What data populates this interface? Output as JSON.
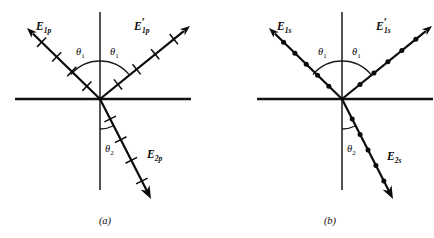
{
  "figure": {
    "type": "optics-ray-diagram",
    "background_color": "#ffffff",
    "ink_color": "#0b0b0b"
  },
  "panels": [
    {
      "id": "a",
      "caption": "(a)",
      "polarization": "p",
      "marker_style": "tick",
      "origin": {
        "x": 100,
        "y": 99
      },
      "interface": {
        "x1": 15,
        "y1": 99,
        "x2": 191,
        "y2": 99
      },
      "normal": {
        "x1": 100,
        "y1": 12,
        "x2": 100,
        "y2": 190
      },
      "rays": [
        {
          "name": "incident",
          "label": "E",
          "label_sub": "1p",
          "label_prime": false,
          "label_x": 36,
          "label_y": 30,
          "angle_deg": 40,
          "tail": {
            "x": 27,
            "y": 28
          },
          "head": {
            "x": 100,
            "y": 99
          },
          "marker_count": 4
        },
        {
          "name": "reflected",
          "label": "E",
          "label_sub": "1p",
          "label_prime": true,
          "label_x": 134,
          "label_y": 30,
          "angle_deg": 40,
          "tail": {
            "x": 100,
            "y": 99
          },
          "head": {
            "x": 190,
            "y": 26
          },
          "marker_count": 4
        },
        {
          "name": "transmitted",
          "label": "E",
          "label_sub": "2p",
          "label_prime": false,
          "label_x": 147,
          "label_y": 158,
          "angle_deg": 20,
          "tail": {
            "x": 100,
            "y": 99
          },
          "head": {
            "x": 151,
            "y": 199
          },
          "marker_count": 4
        }
      ],
      "angles": [
        {
          "name": "theta-1-incident",
          "symbol": "θ",
          "sub": "1",
          "x": 76,
          "y": 55
        },
        {
          "name": "theta-1-reflected",
          "symbol": "θ",
          "sub": "1",
          "x": 110,
          "y": 55
        },
        {
          "name": "theta-2-transmitted",
          "symbol": "θ",
          "sub": "2",
          "x": 105,
          "y": 152
        }
      ],
      "caption_x": 105,
      "caption_y": 224
    },
    {
      "id": "b",
      "caption": "(b)",
      "polarization": "s",
      "marker_style": "dot",
      "origin": {
        "x": 125,
        "y": 99
      },
      "interface": {
        "x1": 40,
        "y1": 99,
        "x2": 216,
        "y2": 99
      },
      "normal": {
        "x1": 125,
        "y1": 12,
        "x2": 125,
        "y2": 190
      },
      "rays": [
        {
          "name": "incident",
          "label": "E",
          "label_sub": "1s",
          "label_prime": false,
          "label_x": 60,
          "label_y": 30,
          "angle_deg": 40,
          "tail": {
            "x": 52,
            "y": 28
          },
          "head": {
            "x": 125,
            "y": 99
          },
          "marker_count": 5
        },
        {
          "name": "reflected",
          "label": "E",
          "label_sub": "1s",
          "label_prime": true,
          "label_x": 159,
          "label_y": 30,
          "angle_deg": 40,
          "tail": {
            "x": 125,
            "y": 99
          },
          "head": {
            "x": 215,
            "y": 26
          },
          "marker_count": 5
        },
        {
          "name": "transmitted",
          "label": "E",
          "label_sub": "2s",
          "label_prime": false,
          "label_x": 170,
          "label_y": 160,
          "angle_deg": 20,
          "tail": {
            "x": 125,
            "y": 99
          },
          "head": {
            "x": 176,
            "y": 199
          },
          "marker_count": 5
        }
      ],
      "angles": [
        {
          "name": "theta-1-incident",
          "symbol": "θ",
          "sub": "1",
          "x": 101,
          "y": 55
        },
        {
          "name": "theta-1-reflected",
          "symbol": "θ",
          "sub": "1",
          "x": 135,
          "y": 55
        },
        {
          "name": "theta-2-transmitted",
          "symbol": "θ",
          "sub": "2",
          "x": 130,
          "y": 152
        }
      ],
      "caption_x": 113,
      "caption_y": 224
    }
  ]
}
